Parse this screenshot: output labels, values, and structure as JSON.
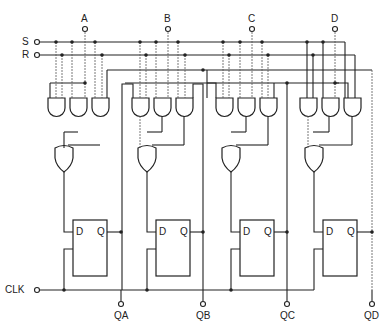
{
  "diagram": {
    "type": "logic-circuit",
    "inputs": {
      "set": "S",
      "reset": "R",
      "clock": "CLK",
      "data": [
        "A",
        "B",
        "C",
        "D"
      ]
    },
    "outputs": [
      "QA",
      "QB",
      "QC",
      "QD"
    ],
    "flipflop": {
      "d_label": "D",
      "q_label": "Q"
    },
    "stages": [
      {
        "name": "A",
        "and_gates": 3,
        "or_gates": 1,
        "flipflop": "D",
        "output": "QA"
      },
      {
        "name": "B",
        "and_gates": 3,
        "or_gates": 1,
        "flipflop": "D",
        "output": "QB"
      },
      {
        "name": "C",
        "and_gates": 3,
        "or_gates": 1,
        "flipflop": "D",
        "output": "QC"
      },
      {
        "name": "D",
        "and_gates": 3,
        "or_gates": 1,
        "flipflop": "D",
        "output": "QD"
      }
    ]
  }
}
